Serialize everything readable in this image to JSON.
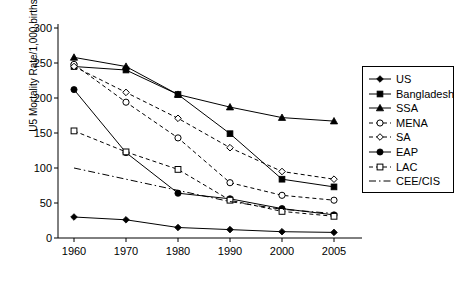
{
  "chart_data": {
    "type": "line",
    "title": "",
    "xlabel": "",
    "ylabel": "U5 Mortality Rate/1,000 births",
    "categories": [
      "1960",
      "1970",
      "1980",
      "1990",
      "2000",
      "2005"
    ],
    "x": [
      1960,
      1970,
      1980,
      1990,
      2000,
      2005
    ],
    "ylim": [
      0,
      300
    ],
    "yticks": [
      0,
      50,
      100,
      150,
      200,
      250,
      300
    ],
    "grid": false,
    "legend_position": "right",
    "series": [
      {
        "name": "US",
        "marker": "filled-diamond",
        "line": "solid",
        "color": "#000000",
        "values": [
          30,
          26,
          15,
          12,
          9,
          8
        ]
      },
      {
        "name": "Bangladesh",
        "marker": "filled-square",
        "line": "solid",
        "color": "#000000",
        "values": [
          245,
          240,
          205,
          149,
          84,
          73
        ]
      },
      {
        "name": "SSA",
        "marker": "filled-triangle",
        "line": "solid",
        "color": "#000000",
        "values": [
          258,
          245,
          205,
          187,
          172,
          167
        ]
      },
      {
        "name": "MENA",
        "marker": "open-circle",
        "line": "dashed",
        "color": "#000000",
        "values": [
          248,
          194,
          143,
          79,
          61,
          54
        ]
      },
      {
        "name": "SA",
        "marker": "open-diamond",
        "line": "dashed",
        "color": "#000000",
        "values": [
          245,
          208,
          171,
          129,
          95,
          84
        ]
      },
      {
        "name": "EAP",
        "marker": "filled-circle",
        "line": "solid",
        "color": "#000000",
        "values": [
          212,
          122,
          64,
          56,
          42,
          33
        ]
      },
      {
        "name": "LAC",
        "marker": "open-square",
        "line": "dashed",
        "color": "#000000",
        "values": [
          153,
          123,
          98,
          54,
          38,
          31
        ]
      },
      {
        "name": "CEE/CIS",
        "marker": "none",
        "line": "dash-dot",
        "color": "#000000",
        "values": [
          100,
          84,
          68,
          52,
          41,
          35
        ]
      }
    ]
  },
  "legend": {
    "entries": [
      {
        "label": "US"
      },
      {
        "label": "Bangladesh"
      },
      {
        "label": "SSA"
      },
      {
        "label": "MENA"
      },
      {
        "label": "SA"
      },
      {
        "label": "EAP"
      },
      {
        "label": "LAC"
      },
      {
        "label": "CEE/CIS"
      }
    ]
  }
}
